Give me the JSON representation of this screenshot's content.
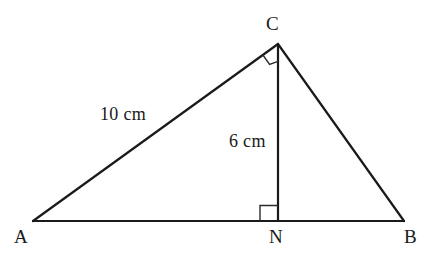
{
  "figure": {
    "background_color": "#ffffff",
    "stroke_color": "#1a1a1a",
    "width": 431,
    "height": 257
  },
  "vertices": [
    {
      "id": "A",
      "label": "A",
      "x": 33,
      "y": 221,
      "label_x": 14,
      "label_y": 227
    },
    {
      "id": "B",
      "label": "B",
      "x": 404,
      "y": 221,
      "label_x": 404,
      "label_y": 227
    },
    {
      "id": "C",
      "label": "C",
      "x": 278,
      "y": 44,
      "label_x": 266,
      "label_y": 14
    },
    {
      "id": "N",
      "label": "N",
      "x": 278,
      "y": 221,
      "label_x": 269,
      "label_y": 227
    }
  ],
  "segments": [
    {
      "id": "AC",
      "from": "A",
      "to": "C"
    },
    {
      "id": "CB",
      "from": "C",
      "to": "B"
    },
    {
      "id": "AB",
      "from": "A",
      "to": "B"
    },
    {
      "id": "CN",
      "from": "C",
      "to": "N"
    }
  ],
  "measures": [
    {
      "id": "AC-length",
      "text": "10 cm",
      "x": 100,
      "y": 105
    },
    {
      "id": "CN-length",
      "text": "6 cm",
      "x": 229,
      "y": 132
    }
  ],
  "right_angles": [
    {
      "id": "angle-at-C",
      "vertex": "C",
      "type": "rotated-square"
    },
    {
      "id": "angle-at-N",
      "vertex": "N",
      "type": "square"
    }
  ]
}
